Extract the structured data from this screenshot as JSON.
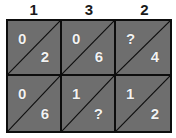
{
  "figure": {
    "type": "grid-puzzle",
    "background_color": "#ffffff",
    "cell_fill_color": "#6e6e6e",
    "line_color": "#0d0d0d",
    "value_text_color": "#f2f2f2",
    "header_text_color": "#1a1a1a",
    "columns": 3,
    "rows": 2
  },
  "column_headers": [
    {
      "label": "1"
    },
    {
      "label": "3"
    },
    {
      "label": "2"
    }
  ],
  "cells": [
    [
      {
        "upper": "0",
        "lower": "2"
      },
      {
        "upper": "0",
        "lower": "6"
      },
      {
        "upper": "?",
        "lower": "4"
      }
    ],
    [
      {
        "upper": "0",
        "lower": "6"
      },
      {
        "upper": "1",
        "lower": "?"
      },
      {
        "upper": "1",
        "lower": "2"
      }
    ]
  ]
}
